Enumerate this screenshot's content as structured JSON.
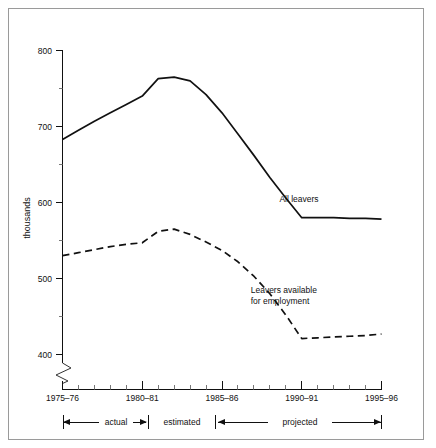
{
  "chart_data": {
    "type": "line",
    "title": "",
    "xlabel": "",
    "ylabel": "thousands",
    "ylim": [
      390,
      810
    ],
    "xlim": [
      1975,
      1995
    ],
    "grid": false,
    "legend_position": "inline-annotations",
    "x_tick_labels": [
      "1975–76",
      "1980–81",
      "1985–86",
      "1990–91",
      "1995–96"
    ],
    "x_tick_values": [
      1975,
      1980,
      1985,
      1990,
      1995
    ],
    "x_minor_ticks": [
      1976,
      1977,
      1978,
      1979,
      1981,
      1982,
      1983,
      1984,
      1986,
      1987,
      1988,
      1989,
      1991,
      1992,
      1993,
      1994
    ],
    "y_tick_labels": [
      "800",
      "700",
      "600",
      "500",
      "400"
    ],
    "y_tick_values": [
      800,
      700,
      600,
      500,
      400
    ],
    "y_minor_ticks": [
      750,
      650,
      550,
      450
    ],
    "axis_break": true,
    "x": [
      1975,
      1976,
      1977,
      1978,
      1979,
      1980,
      1981,
      1982,
      1983,
      1984,
      1985,
      1986,
      1987,
      1988,
      1989,
      1990,
      1991,
      1992,
      1993,
      1994,
      1995
    ],
    "series": [
      {
        "name": "All leavers",
        "style": "solid",
        "values": [
          683,
          695,
          707,
          718,
          729,
          740,
          763,
          765,
          760,
          742,
          718,
          690,
          662,
          633,
          606,
          580,
          580,
          580,
          579,
          579,
          578
        ]
      },
      {
        "name": "Leavers available for employment",
        "style": "dashed",
        "values": [
          530,
          534,
          538,
          542,
          545,
          547,
          562,
          565,
          558,
          548,
          537,
          522,
          503,
          480,
          452,
          421,
          422,
          423,
          424,
          425,
          427
        ]
      }
    ],
    "annotations": [
      {
        "text": "All leavers",
        "x": 1988.6,
        "y": 601
      },
      {
        "text": "Leavers available",
        "x": 1986.8,
        "y": 481
      },
      {
        "text": "for employment",
        "x": 1986.8,
        "y": 467
      }
    ],
    "phases": [
      {
        "label": "actual",
        "start": 1975,
        "end": 1980
      },
      {
        "label": "estimated",
        "start": 1980,
        "end": 1982.2
      },
      {
        "label": "projected",
        "start": 1982.2,
        "end": 1995
      }
    ]
  }
}
